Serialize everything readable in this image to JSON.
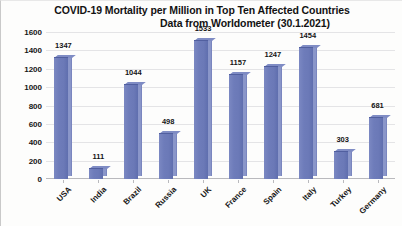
{
  "chart_data": {
    "type": "bar",
    "title": "COVID-19 Mortality per Million in Top Ten Affected Countries",
    "subtitle": "Data from Worldometer (30.1.2021)",
    "xlabel": "",
    "ylabel": "",
    "ylim": [
      0,
      1600
    ],
    "yticks": [
      0,
      200,
      400,
      600,
      800,
      1000,
      1200,
      1400,
      1600
    ],
    "grid": true,
    "legend": false,
    "data_labels": true,
    "bar_color": "#6b79b7",
    "bar_side_color": "#8a96c9",
    "categories": [
      "USA",
      "India",
      "Brazil",
      "Russia",
      "UK",
      "France",
      "Spain",
      "Italy",
      "Turkey",
      "Germany"
    ],
    "values": [
      1347,
      111,
      1044,
      498,
      1533,
      1157,
      1247,
      1454,
      303,
      681
    ]
  },
  "titles": {
    "line1": "COVID-19 Mortality per Million in Top Ten Affected Countries",
    "line2": "Data from Worldometer (30.1.2021)"
  }
}
